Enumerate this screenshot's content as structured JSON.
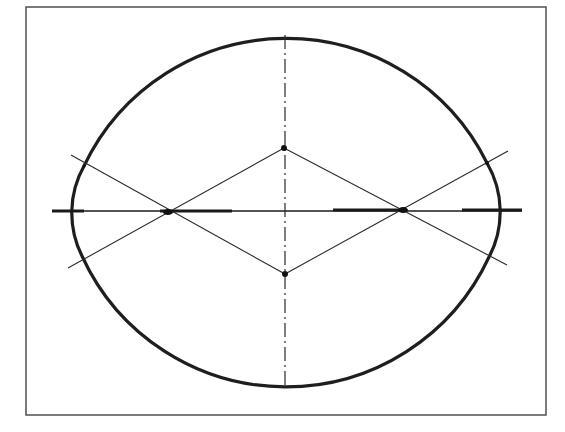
{
  "diagram": {
    "title": "",
    "type": "four-center oval (approximate ellipse) construction",
    "canvas": {
      "width": 565,
      "height": 432
    },
    "colors": {
      "background": "#ffffff",
      "frame": "#5a5a5a",
      "oval": "#1e1e1e",
      "lines": "#2a2a2a"
    },
    "frame": {
      "x": 26,
      "y": 7,
      "width": 520,
      "height": 408
    },
    "major_axis": {
      "x1": 52,
      "y1": 211,
      "x2": 522,
      "y2": 211,
      "style": "solid"
    },
    "minor_axis": {
      "x1": 285,
      "y1": 35,
      "x2": 285,
      "y2": 389,
      "style": "dash-dot"
    },
    "oval": {
      "left": 72,
      "right": 500,
      "top": 50,
      "bottom": 372,
      "arcs": [
        {
          "center": "top",
          "radius": 224,
          "side": "bottom"
        },
        {
          "center": "bottom",
          "radius": 224,
          "side": "top"
        },
        {
          "center": "left",
          "radius": 96,
          "side": "left"
        },
        {
          "center": "right",
          "radius": 97,
          "side": "right"
        }
      ]
    },
    "centers": {
      "top": {
        "x": 284,
        "y": 148
      },
      "right": {
        "x": 403,
        "y": 210
      },
      "bottom": {
        "x": 285,
        "y": 274
      },
      "left": {
        "x": 168,
        "y": 212
      }
    },
    "construction_lines": [
      {
        "name": "upper-left-to-bottom",
        "x1": 71,
        "y1": 155,
        "x2": 285,
        "y2": 274
      },
      {
        "name": "lower-left-to-top",
        "x1": 68,
        "y1": 268,
        "x2": 284,
        "y2": 148
      },
      {
        "name": "top-to-lower-right",
        "x1": 284,
        "y1": 148,
        "x2": 507,
        "y2": 265
      },
      {
        "name": "bottom-to-upper-right",
        "x1": 285,
        "y1": 274,
        "x2": 508,
        "y2": 151
      }
    ],
    "labels": []
  }
}
